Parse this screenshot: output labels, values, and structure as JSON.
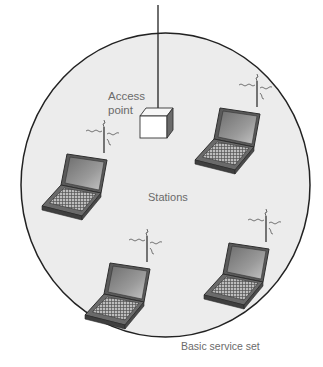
{
  "diagram": {
    "title": "Basic service set",
    "caption": "Basic service set",
    "access_point": {
      "label_line1": "Access",
      "label_line2": "point",
      "icon": "access-point-box-icon"
    },
    "stations_label": "Stations",
    "stations": [
      {
        "id": "station-1",
        "position": "upper-right",
        "icon": "laptop-icon",
        "signal": "wireless-signal-icon"
      },
      {
        "id": "station-2",
        "position": "left",
        "icon": "laptop-icon",
        "signal": "wireless-signal-icon"
      },
      {
        "id": "station-3",
        "position": "lower-right",
        "icon": "laptop-icon",
        "signal": "wireless-signal-icon"
      },
      {
        "id": "station-4",
        "position": "bottom-center",
        "icon": "laptop-icon",
        "signal": "wireless-signal-icon"
      }
    ],
    "colors": {
      "circle_fill": "#ececec",
      "circle_stroke": "#222222",
      "text": "#6a6a6a",
      "laptop_dark": "#555555",
      "laptop_screen": "#8a8a8a"
    }
  }
}
